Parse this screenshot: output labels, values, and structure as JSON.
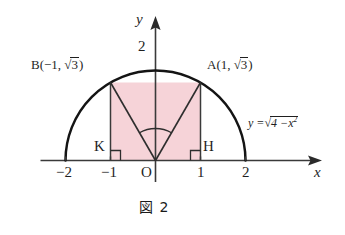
{
  "figure": {
    "caption": "図 2",
    "caption_number": "2",
    "background_color": "#ffffff",
    "curve_color": "#141414",
    "shade_color": "#f6d3d8",
    "axis_color": "#3a3a3a"
  },
  "axes": {
    "x_axis_label": "x",
    "y_axis_label": "y",
    "x_ticks": [
      {
        "value": -2,
        "label": "−2"
      },
      {
        "value": -1,
        "label": "−1"
      },
      {
        "value": 1,
        "label": "1"
      },
      {
        "value": 2,
        "label": "2"
      }
    ],
    "y_ticks": [
      {
        "value": 2,
        "label": "2"
      }
    ],
    "origin_label": "O",
    "x_range": [
      -2.55,
      2.95
    ],
    "y_range": [
      -0.55,
      2.45
    ]
  },
  "curve": {
    "equation_label": "y =",
    "equation_radicand_lead": "4 −",
    "equation_radicand_var": "x",
    "equation_radicand_exp": "2",
    "radical_symbol": "√",
    "radius": 2,
    "center": [
      0,
      0
    ],
    "type": "upper-semicircle"
  },
  "points": [
    {
      "name": "B",
      "label_prefix": "B(−1,",
      "label_radical": "√",
      "label_radicand": "3",
      "label_suffix": ")",
      "x": -1,
      "y": 1.732
    },
    {
      "name": "A",
      "label_prefix": "A(1,",
      "label_radical": "√",
      "label_radicand": "3",
      "label_suffix": ")",
      "x": 1,
      "y": 1.732
    },
    {
      "name": "K",
      "label_prefix": "K",
      "x": -1,
      "y": 0
    },
    {
      "name": "H",
      "label_prefix": "H",
      "x": 1,
      "y": 0
    }
  ],
  "shaded_region": {
    "description": "rectangle KBAH",
    "corners": [
      [
        -1,
        0
      ],
      [
        -1,
        1.732
      ],
      [
        1,
        1.732
      ],
      [
        1,
        0
      ]
    ]
  },
  "segments": [
    {
      "name": "OB",
      "from": [
        0,
        0
      ],
      "to": [
        -1,
        1.732
      ]
    },
    {
      "name": "OA",
      "from": [
        0,
        0
      ],
      "to": [
        1,
        1.732
      ]
    },
    {
      "name": "BK",
      "from": [
        -1,
        1.732
      ],
      "to": [
        -1,
        0
      ]
    },
    {
      "name": "AH",
      "from": [
        1,
        1.732
      ],
      "to": [
        1,
        0
      ]
    }
  ],
  "angle_arc": {
    "name": "angle-AOB",
    "at": [
      0,
      0
    ],
    "radius": 0.62
  },
  "right_angle_marks": [
    {
      "name": "right-angle-K",
      "at": [
        -1,
        0
      ]
    },
    {
      "name": "right-angle-H",
      "at": [
        1,
        0
      ]
    }
  ]
}
